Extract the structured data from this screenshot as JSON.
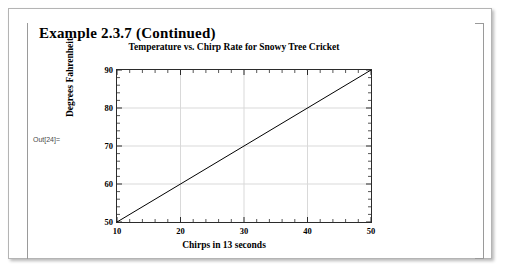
{
  "notebook": {
    "heading": "Example 2.3.7 (Continued)",
    "out_label": "Out[24]="
  },
  "chart_data": {
    "type": "line",
    "title": "Temperature vs. Chirp Rate for Snowy Tree Cricket",
    "xlabel": "Chirps in 13 seconds",
    "ylabel": "Degrees Fahrenheit",
    "xlim": [
      10,
      50
    ],
    "ylim": [
      50,
      90
    ],
    "xticks": [
      10,
      20,
      30,
      40,
      50
    ],
    "yticks": [
      50,
      60,
      70,
      80,
      90
    ],
    "xtick_labels": [
      "10",
      "20",
      "30",
      "40",
      "50"
    ],
    "ytick_labels": [
      "50",
      "60",
      "70",
      "80",
      "90"
    ],
    "minor_ticks_between": 4,
    "grid": true,
    "grid_color": "#d9d9d9",
    "frame": true,
    "frame_color": "#2b2b2b",
    "legend": "none",
    "series": [
      {
        "name": "Temperature",
        "color": "#000000",
        "line_width": 1,
        "x": [
          10,
          50
        ],
        "y": [
          50,
          90
        ]
      }
    ]
  },
  "colors": {
    "background": "#ffffff",
    "window_border": "#b4b4b4",
    "cell_bracket": "#9a9a9a",
    "text": "#000000"
  }
}
